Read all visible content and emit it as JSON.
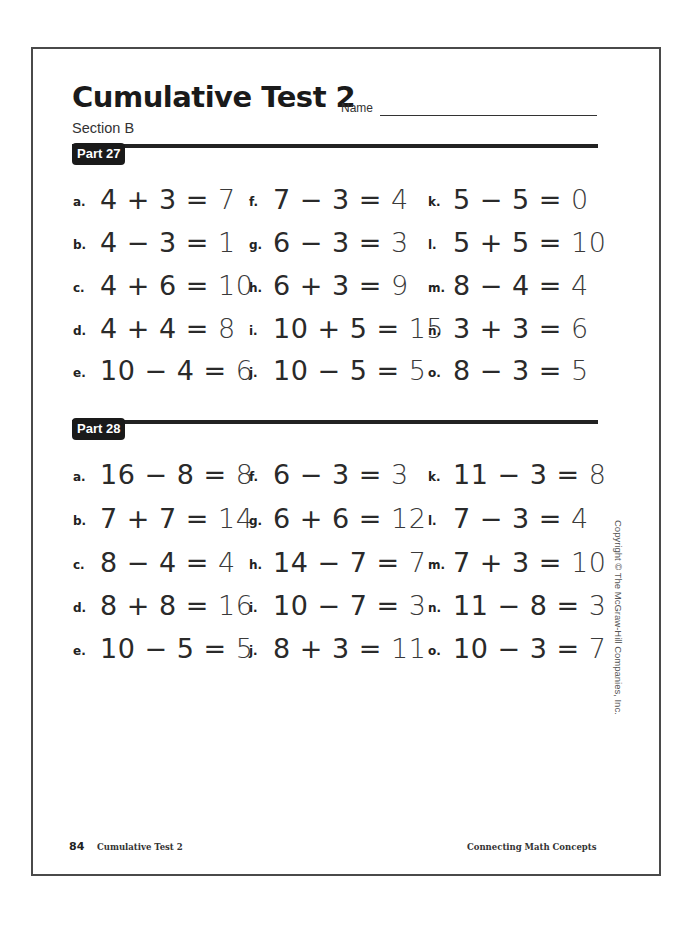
{
  "header": {
    "title": "Cumulative Test 2",
    "name_label": "Name",
    "section": "Section B"
  },
  "parts": [
    {
      "label": "Part 27",
      "problems": [
        {
          "letter": "a.",
          "expr": "4 + 3 =",
          "answer": "7"
        },
        {
          "letter": "b.",
          "expr": "4 − 3 =",
          "answer": "1"
        },
        {
          "letter": "c.",
          "expr": "4 + 6 =",
          "answer": "10"
        },
        {
          "letter": "d.",
          "expr": "4 + 4 =",
          "answer": "8"
        },
        {
          "letter": "e.",
          "expr": "10 − 4 =",
          "answer": "6"
        },
        {
          "letter": "f.",
          "expr": "7 − 3 =",
          "answer": "4"
        },
        {
          "letter": "g.",
          "expr": "6 − 3 =",
          "answer": "3"
        },
        {
          "letter": "h.",
          "expr": "6 + 3 =",
          "answer": "9"
        },
        {
          "letter": "i.",
          "expr": "10 + 5 =",
          "answer": "15"
        },
        {
          "letter": "j.",
          "expr": "10 − 5 =",
          "answer": "5"
        },
        {
          "letter": "k.",
          "expr": "5 − 5 =",
          "answer": "0"
        },
        {
          "letter": "l.",
          "expr": "5 + 5 =",
          "answer": "10"
        },
        {
          "letter": "m.",
          "expr": "8 − 4 =",
          "answer": "4"
        },
        {
          "letter": "n.",
          "expr": "3 + 3 =",
          "answer": "6"
        },
        {
          "letter": "o.",
          "expr": "8 − 3 =",
          "answer": "5"
        }
      ]
    },
    {
      "label": "Part 28",
      "problems": [
        {
          "letter": "a.",
          "expr": "16 − 8 =",
          "answer": "8"
        },
        {
          "letter": "b.",
          "expr": "7 + 7 =",
          "answer": "14"
        },
        {
          "letter": "c.",
          "expr": "8 − 4 =",
          "answer": "4"
        },
        {
          "letter": "d.",
          "expr": "8 + 8 =",
          "answer": "16"
        },
        {
          "letter": "e.",
          "expr": "10 − 5 =",
          "answer": "5"
        },
        {
          "letter": "f.",
          "expr": "6 − 3 =",
          "answer": "3"
        },
        {
          "letter": "g.",
          "expr": "6 + 6 =",
          "answer": "12"
        },
        {
          "letter": "h.",
          "expr": "14 − 7 =",
          "answer": "7"
        },
        {
          "letter": "i.",
          "expr": "10 − 7 =",
          "answer": "3"
        },
        {
          "letter": "j.",
          "expr": "8 + 3 =",
          "answer": "11"
        },
        {
          "letter": "k.",
          "expr": "11 − 3 =",
          "answer": "8"
        },
        {
          "letter": "l.",
          "expr": "7 − 3 =",
          "answer": "4"
        },
        {
          "letter": "m.",
          "expr": "7 + 3 =",
          "answer": "10"
        },
        {
          "letter": "n.",
          "expr": "11 − 8 =",
          "answer": "3"
        },
        {
          "letter": "o.",
          "expr": "10 − 3 =",
          "answer": "7"
        }
      ]
    }
  ],
  "copyright": "Copyright © The McGraw-Hill Companies, Inc.",
  "footer": {
    "page_number": "84",
    "page_title": "Cumulative Test 2",
    "book": "Connecting Math Concepts"
  }
}
